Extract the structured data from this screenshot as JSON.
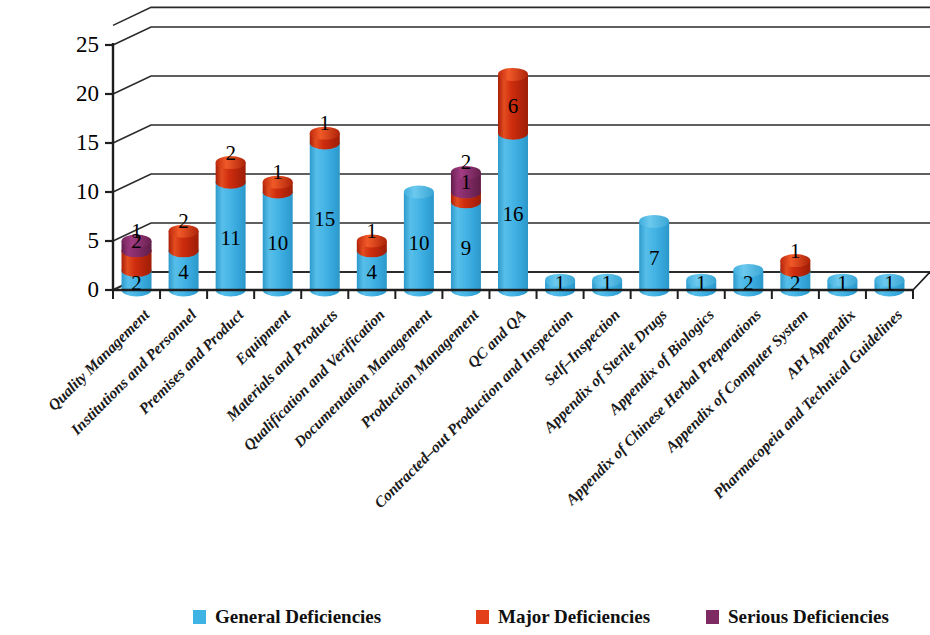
{
  "chart_data": {
    "type": "bar",
    "subtype": "stacked-3d-cylinder",
    "title": "",
    "xlabel": "",
    "ylabel": "",
    "ylim": [
      0,
      27
    ],
    "yticks": [
      0,
      5,
      10,
      15,
      20,
      25
    ],
    "grid": true,
    "legend_position": "bottom",
    "categories": [
      "Quality Management",
      "Institutions and Personnel",
      "Premises and Product",
      "Equipment",
      "Materials and Products",
      "Qualification and Verification",
      "Documentation Management",
      "Production Management",
      "QC and QA",
      "Contracted–out Production and Inspection",
      "Self–Inspection",
      "Appendix of Sterile Drugs",
      "Appendix of Biologics",
      "Appendix of Chinese Herbal Preparations",
      "Appendix of Computer System",
      "API Appendix",
      "Pharmacopeia and Technical Guidelines"
    ],
    "series": [
      {
        "name": "General Deficiencies",
        "color": "#3FB3E3",
        "values": [
          2,
          4,
          11,
          10,
          15,
          4,
          10,
          9,
          16,
          1,
          1,
          7,
          1,
          2,
          2,
          1,
          1
        ]
      },
      {
        "name": "Major Deficiencies",
        "color": "#E3401A",
        "values": [
          2,
          2,
          2,
          1,
          1,
          1,
          0,
          1,
          6,
          0,
          0,
          0,
          0,
          0,
          1,
          0,
          0
        ]
      },
      {
        "name": "Serious Deficiencies",
        "color": "#7E2A63",
        "values": [
          1,
          0,
          0,
          0,
          0,
          0,
          0,
          2,
          0,
          0,
          0,
          0,
          0,
          0,
          0,
          0,
          0
        ]
      }
    ]
  },
  "axis": {
    "y_tick_labels": [
      "0",
      "5",
      "10",
      "15",
      "20",
      "25"
    ]
  },
  "legend": {
    "items": [
      {
        "label": "General Deficiencies",
        "color": "#3FB3E3"
      },
      {
        "label": "Major Deficiencies",
        "color": "#E3401A"
      },
      {
        "label": "Serious Deficiencies",
        "color": "#7E2A63"
      }
    ]
  }
}
